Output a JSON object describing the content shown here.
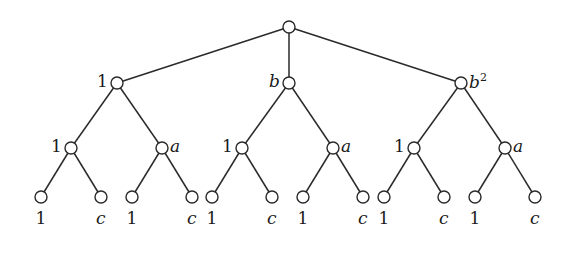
{
  "tree": {
    "node_radius": 6,
    "stroke_color": "#2a2a2a",
    "nodes": [
      {
        "id": "root",
        "x": 289,
        "y": 27,
        "label": "",
        "label_side": "none",
        "italic": false
      },
      {
        "id": "L1-0",
        "x": 117,
        "y": 83,
        "label": "1",
        "label_side": "left",
        "italic": false
      },
      {
        "id": "L1-1",
        "x": 289,
        "y": 83,
        "label": "b",
        "label_side": "left",
        "italic": true
      },
      {
        "id": "L1-2",
        "x": 461,
        "y": 83,
        "label": "b",
        "sup": "2",
        "label_side": "right",
        "italic": true
      },
      {
        "id": "L2-0",
        "x": 71,
        "y": 148,
        "label": "1",
        "label_side": "left",
        "italic": false
      },
      {
        "id": "L2-1",
        "x": 162,
        "y": 148,
        "label": "a",
        "label_side": "right",
        "italic": true
      },
      {
        "id": "L2-2",
        "x": 242,
        "y": 148,
        "label": "1",
        "label_side": "left",
        "italic": false
      },
      {
        "id": "L2-3",
        "x": 333,
        "y": 148,
        "label": "a",
        "label_side": "right",
        "italic": true
      },
      {
        "id": "L2-4",
        "x": 414,
        "y": 148,
        "label": "1",
        "label_side": "left",
        "italic": false
      },
      {
        "id": "L2-5",
        "x": 505,
        "y": 148,
        "label": "a",
        "label_side": "right",
        "italic": true
      },
      {
        "id": "L3-0",
        "x": 41,
        "y": 197,
        "label": "1",
        "label_side": "below",
        "italic": false
      },
      {
        "id": "L3-1",
        "x": 101,
        "y": 197,
        "label": "c",
        "label_side": "below",
        "italic": true
      },
      {
        "id": "L3-2",
        "x": 132,
        "y": 197,
        "label": "1",
        "label_side": "below",
        "italic": false
      },
      {
        "id": "L3-3",
        "x": 192,
        "y": 197,
        "label": "c",
        "label_side": "below",
        "italic": true
      },
      {
        "id": "L3-4",
        "x": 212,
        "y": 197,
        "label": "1",
        "label_side": "below",
        "italic": false
      },
      {
        "id": "L3-5",
        "x": 272,
        "y": 197,
        "label": "c",
        "label_side": "below",
        "italic": true
      },
      {
        "id": "L3-6",
        "x": 303,
        "y": 197,
        "label": "1",
        "label_side": "below",
        "italic": false
      },
      {
        "id": "L3-7",
        "x": 363,
        "y": 197,
        "label": "c",
        "label_side": "below",
        "italic": true
      },
      {
        "id": "L3-8",
        "x": 384,
        "y": 197,
        "label": "1",
        "label_side": "below",
        "italic": false
      },
      {
        "id": "L3-9",
        "x": 444,
        "y": 197,
        "label": "c",
        "label_side": "below",
        "italic": true
      },
      {
        "id": "L3-10",
        "x": 475,
        "y": 197,
        "label": "1",
        "label_side": "below",
        "italic": false
      },
      {
        "id": "L3-11",
        "x": 535,
        "y": 197,
        "label": "c",
        "label_side": "below",
        "italic": true
      }
    ],
    "edges": [
      [
        "root",
        "L1-0"
      ],
      [
        "root",
        "L1-1"
      ],
      [
        "root",
        "L1-2"
      ],
      [
        "L1-0",
        "L2-0"
      ],
      [
        "L1-0",
        "L2-1"
      ],
      [
        "L1-1",
        "L2-2"
      ],
      [
        "L1-1",
        "L2-3"
      ],
      [
        "L1-2",
        "L2-4"
      ],
      [
        "L1-2",
        "L2-5"
      ],
      [
        "L2-0",
        "L3-0"
      ],
      [
        "L2-0",
        "L3-1"
      ],
      [
        "L2-1",
        "L3-2"
      ],
      [
        "L2-1",
        "L3-3"
      ],
      [
        "L2-2",
        "L3-4"
      ],
      [
        "L2-2",
        "L3-5"
      ],
      [
        "L2-3",
        "L3-6"
      ],
      [
        "L2-3",
        "L3-7"
      ],
      [
        "L2-4",
        "L3-8"
      ],
      [
        "L2-4",
        "L3-9"
      ],
      [
        "L2-5",
        "L3-10"
      ],
      [
        "L2-5",
        "L3-11"
      ]
    ]
  }
}
